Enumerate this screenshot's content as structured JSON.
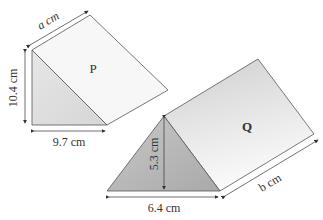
{
  "prism_p": {
    "label": "P",
    "side_label": "a cm",
    "height_label": "10.4 cm",
    "base_label": "9.7 cm"
  },
  "prism_q": {
    "label": "Q",
    "height_label": "5.3 cm",
    "base_label": "6.4 cm",
    "length_label": "b cm"
  },
  "colors": {
    "edge": "#555555",
    "face_light": "#f2f2f2",
    "face_mid": "#d8d8d8",
    "face_dark": "#bdbdbd"
  }
}
